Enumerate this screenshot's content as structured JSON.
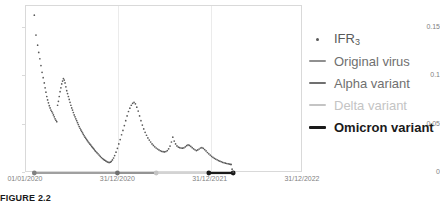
{
  "caption": "FIGURE 2.2",
  "chart_data": {
    "type": "scatter",
    "title": "",
    "xlabel": "",
    "ylabel": "",
    "grid": "vertical-gridlines-at-variant-boundaries",
    "legend_position": "right",
    "ylim": [
      0,
      0.1725
    ],
    "yticks": [
      "0",
      "0.05",
      "0.1",
      "0.15"
    ],
    "ytick_values": [
      0,
      0.05,
      0.1,
      0.15
    ],
    "xticks": [
      "01/01/2020",
      "31/12/2020",
      "31/12/2021",
      "31/12/2022"
    ],
    "xlim": [
      "01/01/2020",
      "31/12/2022"
    ],
    "series": [
      {
        "name": "IFR_3",
        "label": "IFR",
        "sublabel": "3",
        "marker": "dot",
        "color": "#595959",
        "x": [
          0.03,
          0.036,
          0.042,
          0.046,
          0.05,
          0.054,
          0.058,
          0.062,
          0.066,
          0.069,
          0.072,
          0.075,
          0.078,
          0.081,
          0.084,
          0.087,
          0.09,
          0.093,
          0.096,
          0.099,
          0.102,
          0.105,
          0.108,
          0.111,
          0.114,
          0.117,
          0.12,
          0.123,
          0.126,
          0.129,
          0.132,
          0.135,
          0.138,
          0.141,
          0.144,
          0.147,
          0.15,
          0.153,
          0.156,
          0.159,
          0.162,
          0.165,
          0.168,
          0.171,
          0.174,
          0.177,
          0.18,
          0.183,
          0.186,
          0.189,
          0.192,
          0.195,
          0.198,
          0.201,
          0.204,
          0.207,
          0.21,
          0.213,
          0.216,
          0.219,
          0.222,
          0.225,
          0.228,
          0.231,
          0.234,
          0.237,
          0.24,
          0.243,
          0.246,
          0.249,
          0.252,
          0.256,
          0.26,
          0.264,
          0.268,
          0.272,
          0.276,
          0.28,
          0.284,
          0.288,
          0.292,
          0.296,
          0.3,
          0.304,
          0.308,
          0.312,
          0.316,
          0.32,
          0.325,
          0.33,
          0.335,
          0.34,
          0.345,
          0.35,
          0.355,
          0.36,
          0.365,
          0.37,
          0.375,
          0.38,
          0.385,
          0.39,
          0.395,
          0.4,
          0.405,
          0.41,
          0.415,
          0.42,
          0.425,
          0.43,
          0.435,
          0.44,
          0.445,
          0.45,
          0.455,
          0.46,
          0.465,
          0.47,
          0.475,
          0.48,
          0.485,
          0.49,
          0.495,
          0.5,
          0.505,
          0.51,
          0.515,
          0.52,
          0.525,
          0.53,
          0.535,
          0.54,
          0.545,
          0.55,
          0.555,
          0.56,
          0.565,
          0.57,
          0.575,
          0.58,
          0.585,
          0.59,
          0.595,
          0.6,
          0.605,
          0.61,
          0.615,
          0.62,
          0.625,
          0.63,
          0.635,
          0.64,
          0.645,
          0.65,
          0.655,
          0.66,
          0.665,
          0.67,
          0.675,
          0.68,
          0.685,
          0.69,
          0.695,
          0.7,
          0.705,
          0.71,
          0.715,
          0.72,
          0.725,
          0.73,
          0.735,
          0.74
        ],
        "y": [
          0.163,
          0.1425,
          0.132,
          0.1245,
          0.118,
          0.111,
          0.104,
          0.0985,
          0.093,
          0.088,
          0.0835,
          0.079,
          0.0755,
          0.0725,
          0.0695,
          0.0672,
          0.065,
          0.0635,
          0.062,
          0.06,
          0.058,
          0.056,
          0.0545,
          0.053,
          0.07,
          0.074,
          0.079,
          0.084,
          0.088,
          0.092,
          0.095,
          0.0975,
          0.096,
          0.093,
          0.089,
          0.085,
          0.082,
          0.079,
          0.076,
          0.073,
          0.07,
          0.0672,
          0.065,
          0.0625,
          0.06,
          0.058,
          0.056,
          0.054,
          0.052,
          0.05,
          0.048,
          0.0462,
          0.0445,
          0.043,
          0.0415,
          0.04,
          0.0385,
          0.037,
          0.0358,
          0.0345,
          0.0332,
          0.032,
          0.031,
          0.0298,
          0.0288,
          0.0276,
          0.0265,
          0.0255,
          0.0245,
          0.0232,
          0.0222,
          0.021,
          0.0198,
          0.0185,
          0.0172,
          0.016,
          0.015,
          0.014,
          0.0132,
          0.0125,
          0.0118,
          0.0112,
          0.0108,
          0.0112,
          0.012,
          0.0135,
          0.0155,
          0.018,
          0.0215,
          0.0255,
          0.03,
          0.0345,
          0.0395,
          0.044,
          0.049,
          0.054,
          0.059,
          0.0635,
          0.067,
          0.07,
          0.072,
          0.073,
          0.0715,
          0.068,
          0.064,
          0.059,
          0.054,
          0.0495,
          0.0455,
          0.042,
          0.039,
          0.0362,
          0.034,
          0.032,
          0.03,
          0.0285,
          0.027,
          0.0258,
          0.0248,
          0.0238,
          0.023,
          0.0224,
          0.022,
          0.0218,
          0.0222,
          0.0232,
          0.025,
          0.0278,
          0.032,
          0.037,
          0.033,
          0.03,
          0.028,
          0.0268,
          0.0262,
          0.0258,
          0.0256,
          0.026,
          0.027,
          0.0282,
          0.029,
          0.0285,
          0.0275,
          0.0262,
          0.025,
          0.024,
          0.0232,
          0.0238,
          0.0248,
          0.0258,
          0.0262,
          0.0255,
          0.0242,
          0.0228,
          0.0212,
          0.0198,
          0.0185,
          0.0172,
          0.0162,
          0.0152,
          0.0144,
          0.0136,
          0.0128,
          0.0122,
          0.0116,
          0.011,
          0.0106,
          0.0102,
          0.0098,
          0.0095,
          0.0092,
          0.009
        ]
      }
    ],
    "variant_periods": [
      {
        "name": "Original virus",
        "label": "Original virus",
        "color": "#808080",
        "x_start": 0.03,
        "x_end": 0.33,
        "y": 0
      },
      {
        "name": "Alpha variant",
        "label": "Alpha variant",
        "color": "#707070",
        "x_start": 0.33,
        "x_end": 0.47,
        "y": 0
      },
      {
        "name": "Delta variant",
        "label": "Delta variant",
        "color": "#c4c4c4",
        "x_start": 0.47,
        "x_end": 0.66,
        "y": 0
      },
      {
        "name": "Omicron variant",
        "label": "Omicron variant",
        "color": "#1a1a1a",
        "x_start": 0.66,
        "x_end": 0.748,
        "y": 0
      }
    ],
    "tail_values": {
      "x": [
        0.74,
        0.744,
        0.748
      ],
      "y": [
        0.0088,
        0.004,
        0.001
      ]
    }
  },
  "legend": {
    "items": [
      {
        "label": "IFR",
        "sublabel": "3",
        "swatch": "dot",
        "color": "#595959",
        "weight": "normal"
      },
      {
        "label": "Original virus",
        "sublabel": "",
        "swatch": "line",
        "color": "#909090",
        "weight": "normal"
      },
      {
        "label": "Alpha variant",
        "sublabel": "",
        "swatch": "line",
        "color": "#707070",
        "weight": "normal"
      },
      {
        "label": "Delta variant",
        "sublabel": "",
        "swatch": "line",
        "color": "#c4c4c4",
        "weight": "normal"
      },
      {
        "label": "Omicron variant",
        "sublabel": "",
        "swatch": "line",
        "color": "#1a1a1a",
        "weight": "bold"
      }
    ]
  },
  "axes": {
    "y_labels": [
      "0.15",
      "0.1",
      "0.05",
      "0"
    ],
    "x_labels": [
      "01/01/2020",
      "31/12/2020",
      "31/12/2021",
      "31/12/2022"
    ]
  }
}
